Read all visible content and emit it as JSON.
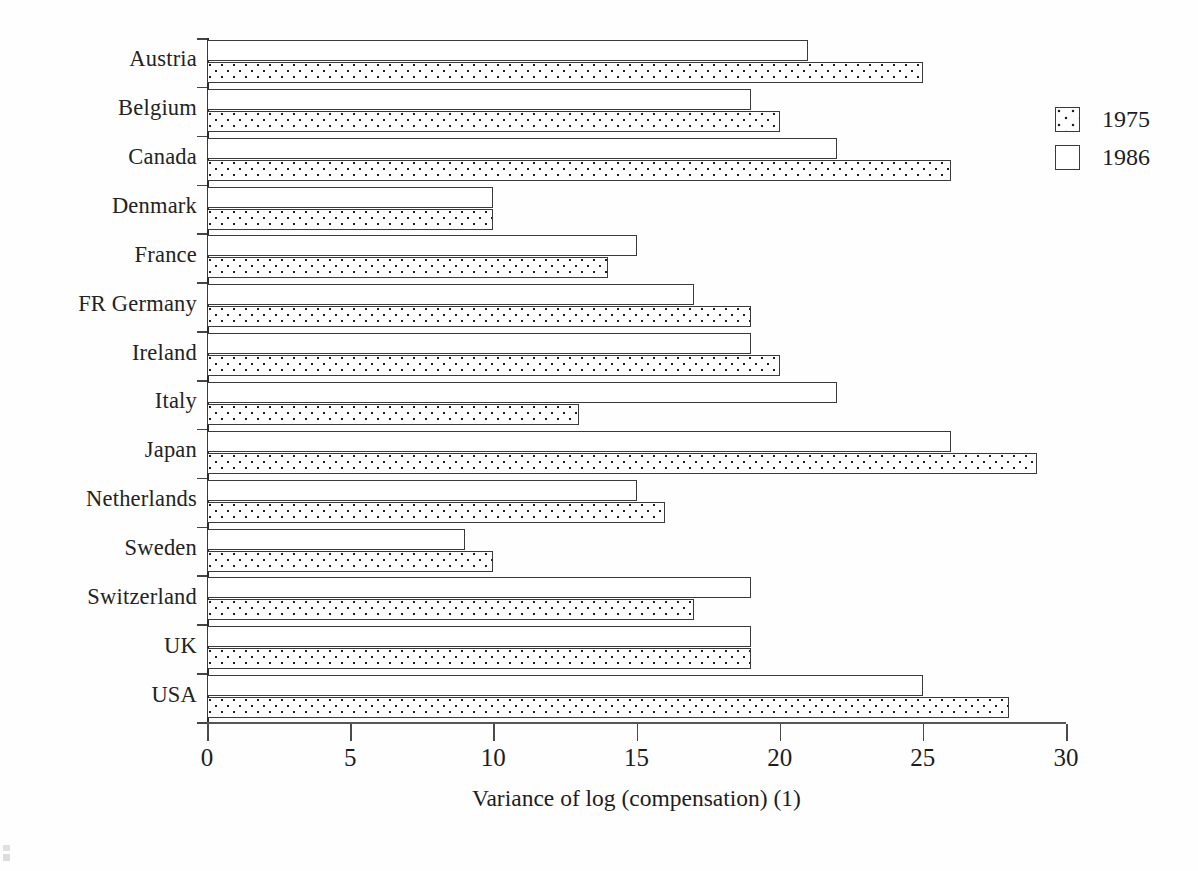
{
  "chart_data": {
    "type": "bar",
    "orientation": "horizontal",
    "title": "",
    "xlabel": "Variance of log (compensation) (1)",
    "ylabel": "",
    "xlim": [
      0,
      30
    ],
    "xticks": [
      0,
      5,
      10,
      15,
      20,
      25,
      30
    ],
    "xticklabels": [
      "0",
      "5",
      "10",
      "15",
      "20",
      "25",
      "30"
    ],
    "grid": false,
    "legend_position": "upper right",
    "categories": [
      "Austria",
      "Belgium",
      "Canada",
      "Denmark",
      "France",
      "FR Germany",
      "Ireland",
      "Italy",
      "Japan",
      "Netherlands",
      "Sweden",
      "Switzerland",
      "UK",
      "USA"
    ],
    "series": [
      {
        "name": "1986",
        "pattern": "open",
        "values": [
          21,
          19,
          22,
          10,
          15,
          17,
          19,
          22,
          26,
          15,
          9,
          19,
          19,
          25
        ]
      },
      {
        "name": "1975",
        "pattern": "dotted",
        "values": [
          25,
          20,
          26,
          10,
          14,
          19,
          20,
          13,
          29,
          16,
          10,
          17,
          19,
          28
        ]
      }
    ]
  },
  "legend": {
    "items": [
      {
        "label": "1975",
        "swatch": "dotted-square-swatch"
      },
      {
        "label": "1986",
        "swatch": "open-square-swatch"
      }
    ]
  },
  "colors": {
    "bar_outline": "#3a3a3a",
    "dot_fill": "#1d1d1d",
    "open_fill": "#ffffff",
    "axis": "#2b2b2b",
    "text": "#1d1d1d",
    "background": "#fefefe"
  }
}
